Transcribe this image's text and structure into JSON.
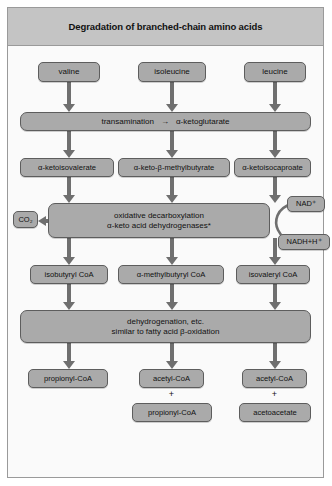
{
  "figure": {
    "title": "Degradation of branched-chain amino acids"
  },
  "substrates": [
    {
      "label": "valine"
    },
    {
      "label": "isoleucine"
    },
    {
      "label": "leucine"
    }
  ],
  "transamination": {
    "label": "transamination",
    "arrow_glyph": "→",
    "product": "α-ketoglutarate"
  },
  "keto_acids": [
    {
      "label": "α-ketoisovalerate"
    },
    {
      "label": "α-keto-β-methylbutyrate"
    },
    {
      "label": "α-ketoisocaproate"
    }
  ],
  "decarboxylation": {
    "line1": "oxidative decarboxylation",
    "line2": "α-keto acid dehydrogenases*"
  },
  "cofactors": {
    "co2": "CO₂",
    "nad": "NAD⁺",
    "nadh": "NADH+H⁺"
  },
  "coa_intermediates": [
    {
      "label": "isobutyryl CoA"
    },
    {
      "label": "α-methylbutyryl CoA"
    },
    {
      "label": "isovaleryl CoA"
    }
  ],
  "dehydrogenation": {
    "line1": "dehydrogenation, etc.",
    "line2": "similar to fatty acid β-oxidation"
  },
  "products": {
    "column1": [
      {
        "label": "propionyl-CoA"
      }
    ],
    "column2": [
      {
        "label": "acetyl-CoA"
      },
      {
        "label": "propionyl-CoA"
      }
    ],
    "column3": [
      {
        "label": "acetyl-CoA"
      },
      {
        "label": "acetoacetate"
      }
    ],
    "plus_glyph": "+"
  },
  "colors": {
    "box_fill": "#aaaaaa",
    "box_border": "#5d5d5d",
    "title_band": "#c4c4c4",
    "arrow": "#6f6f6f",
    "page_background": "#fafafa"
  }
}
